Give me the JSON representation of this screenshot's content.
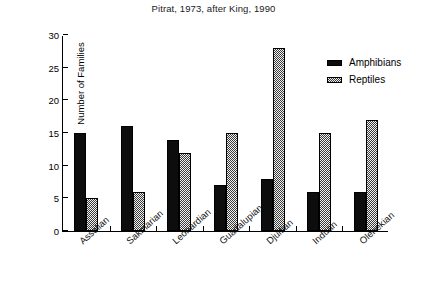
{
  "chart_data": {
    "type": "bar",
    "title": "Pitrat, 1973, after King, 1990",
    "xlabel": "",
    "ylabel": "Number of Families",
    "ylim": [
      0,
      30
    ],
    "yticks": [
      0,
      5,
      10,
      15,
      20,
      25,
      30
    ],
    "grid": false,
    "legend_position": "top-right",
    "categories": [
      "Asselian",
      "Sakmarian",
      "Leonardian",
      "Guadalupian",
      "Djulfian",
      "Induan",
      "Olenekian"
    ],
    "series": [
      {
        "name": "Amphibians",
        "color": "#0d0d0d",
        "fill": "solid-black",
        "values": [
          15,
          16,
          14,
          7,
          8,
          6,
          6
        ]
      },
      {
        "name": "Reptiles",
        "color": "#3a3a3a",
        "fill": "checkerboard-dither",
        "values": [
          5,
          6,
          12,
          15,
          28,
          15,
          17
        ]
      }
    ]
  }
}
